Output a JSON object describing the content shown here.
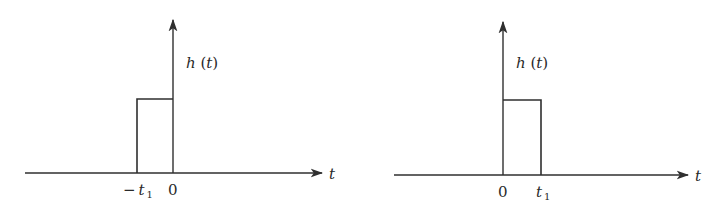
{
  "figures": [
    {
      "id": "left",
      "ylabel": "h (t)",
      "ylabel_func": "h",
      "ylabel_arg": "t",
      "xlabel": "t",
      "ticks": [
        {
          "sign": "−",
          "var": "t",
          "sub": "1"
        },
        {
          "text": "0"
        }
      ],
      "pulse": {
        "start": "-t1",
        "end": "0",
        "height": "1"
      }
    },
    {
      "id": "right",
      "ylabel": "h (t)",
      "ylabel_func": "h",
      "ylabel_arg": "t",
      "xlabel": "t",
      "ticks": [
        {
          "text": "0"
        },
        {
          "var": "t",
          "sub": "1"
        }
      ],
      "pulse": {
        "start": "0",
        "end": "t1",
        "height": "1"
      }
    }
  ],
  "colors": {
    "line": "#2f2f2f",
    "text": "#2a2a2a",
    "background": "#ffffff"
  }
}
